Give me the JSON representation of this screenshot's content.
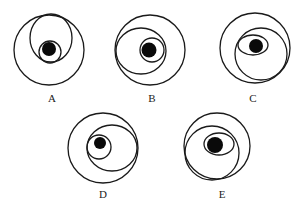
{
  "figure": {
    "colors": {
      "stroke": "#1a1a1a",
      "dot": "#0a0a0a",
      "background": "#ffffff"
    },
    "options": [
      {
        "label": "A",
        "outer": {
          "cx": 49,
          "cy": 50,
          "r": 35
        },
        "middle": {
          "shape": "ellipse",
          "cx": 51,
          "cy": 38,
          "rx": 21,
          "ry": 24
        },
        "inner": {
          "shape": "circle",
          "cx": 50,
          "cy": 52,
          "r": 11
        },
        "dot": {
          "cx": 49,
          "cy": 49,
          "r": 7
        },
        "label_pos": {
          "x": 52,
          "y": 102
        }
      },
      {
        "label": "B",
        "outer": {
          "cx": 150,
          "cy": 50,
          "r": 35
        },
        "middle": {
          "shape": "ellipse",
          "cx": 141,
          "cy": 51,
          "rx": 25,
          "ry": 23
        },
        "inner": {
          "shape": "circle",
          "cx": 152,
          "cy": 50,
          "r": 12
        },
        "dot": {
          "cx": 149,
          "cy": 50,
          "r": 7.5
        },
        "label_pos": {
          "x": 152,
          "y": 102
        }
      },
      {
        "label": "C",
        "outer": {
          "cx": 255,
          "cy": 48,
          "r": 35
        },
        "middle": {
          "shape": "circle",
          "cx": 261,
          "cy": 54,
          "r": 26
        },
        "inner": {
          "shape": "ellipse",
          "cx": 253,
          "cy": 45,
          "rx": 15,
          "ry": 10
        },
        "dot": {
          "cx": 256,
          "cy": 46,
          "r": 7
        },
        "label_pos": {
          "x": 253,
          "y": 102
        }
      },
      {
        "label": "D",
        "outer": {
          "cx": 103,
          "cy": 148,
          "r": 35
        },
        "middle": {
          "shape": "ellipse",
          "cx": 112,
          "cy": 148,
          "rx": 25,
          "ry": 23
        },
        "inner": {
          "shape": "circle",
          "cx": 99,
          "cy": 147,
          "r": 12
        },
        "dot": {
          "cx": 100,
          "cy": 143,
          "r": 6
        },
        "label_pos": {
          "x": 103,
          "y": 198
        }
      },
      {
        "label": "E",
        "outer": {
          "cx": 217,
          "cy": 146,
          "r": 33
        },
        "middle": {
          "shape": "circle",
          "cx": 212,
          "cy": 153,
          "r": 27
        },
        "inner": {
          "shape": "ellipse",
          "cx": 219,
          "cy": 144,
          "rx": 15,
          "ry": 11
        },
        "dot": {
          "cx": 215,
          "cy": 145,
          "r": 8
        },
        "label_pos": {
          "x": 222,
          "y": 198
        }
      }
    ]
  }
}
